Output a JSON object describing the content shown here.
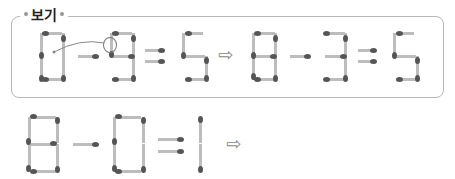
{
  "example": {
    "label": "보기",
    "left_equation": "0 - 9 = 5",
    "right_equation": "8 - 3 = 5",
    "arrow": "⇨",
    "annotation": "move one match from 9 to 0"
  },
  "problem": {
    "equation": "8 - 0 = 1",
    "arrow": "⇨"
  }
}
